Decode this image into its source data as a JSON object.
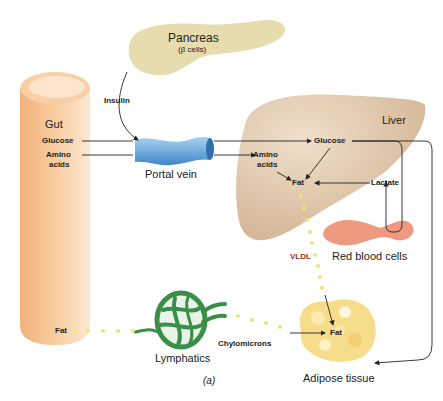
{
  "organs": {
    "pancreas": {
      "label": "Pancreas",
      "sublabel": "(β cells)",
      "color": "#e6dcae"
    },
    "gut": {
      "label": "Gut",
      "color": "#f6c494"
    },
    "portal_vein": {
      "label": "Portal vein",
      "color": "#5b9fd8"
    },
    "liver": {
      "label": "Liver",
      "color": "#d9bc9c"
    },
    "red_blood_cells": {
      "label": "Red blood cells",
      "color": "#ef9a80"
    },
    "lymphatics": {
      "label": "Lymphatics",
      "color": "#3a8f48"
    },
    "adipose_tissue": {
      "label": "Adipose tissue",
      "color": "#f6dd8c"
    }
  },
  "gut_labels": {
    "glucose": "Glucose",
    "amino_line1": "Amino",
    "amino_line2": "acids",
    "fat": "Fat"
  },
  "liver_labels": {
    "glucose": "Glucose",
    "amino_line1": "Amino",
    "amino_line2": "acids",
    "fat": "Fat",
    "lactate": "Lactate"
  },
  "hormone": {
    "insulin": "Insulin"
  },
  "transport": {
    "vldl": "VLDL",
    "chylomicrons": "Chylomicrons"
  },
  "adipose_labels": {
    "fat": "Fat"
  },
  "caption": {
    "panel": "(a)"
  }
}
